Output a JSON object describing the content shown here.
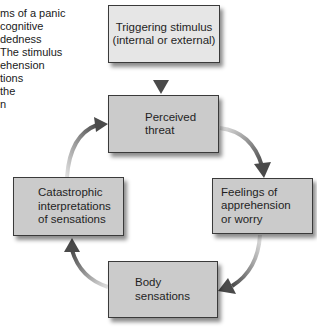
{
  "intro_text": "ms of a panic\ncognitive\ndedness\nThe stimulus\nehension\ntions\nthe\nn",
  "nodes": {
    "trigger": {
      "label": "Triggering stimulus\n(internal or external)"
    },
    "threat": {
      "label": "Perceived\nthreat"
    },
    "feelings": {
      "label": "Feelings of\napprehension\nor worry"
    },
    "body": {
      "label": "Body\nsensations"
    },
    "catastrophic": {
      "label": "Catastrophic\ninterpretations\nof sensations"
    }
  },
  "edges": [
    {
      "from": "trigger",
      "to": "threat"
    },
    {
      "from": "threat",
      "to": "feelings"
    },
    {
      "from": "feelings",
      "to": "body"
    },
    {
      "from": "body",
      "to": "catastrophic"
    },
    {
      "from": "catastrophic",
      "to": "threat"
    }
  ],
  "colors": {
    "box_fill": "#cbcbcb",
    "trigger_fill": "#e6e6e6",
    "border": "#3a3a3a",
    "arrow_dark": "#4a4a4a",
    "arrow_light": "#d8d8d8"
  }
}
